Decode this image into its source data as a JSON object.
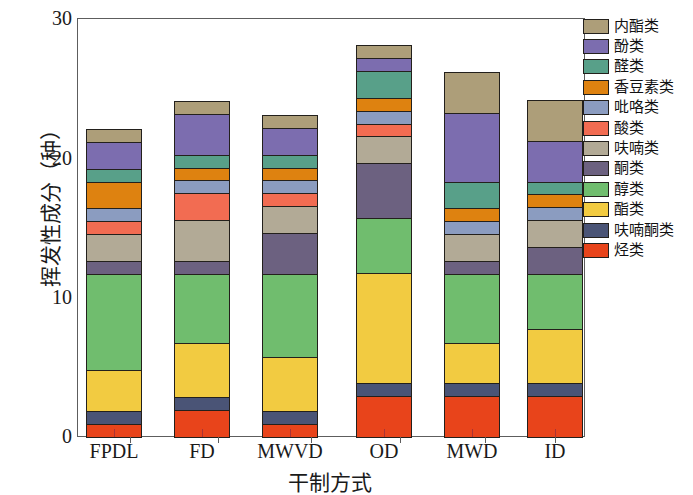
{
  "chart_data": {
    "type": "bar",
    "subtype": "stacked-bar",
    "title": "",
    "xlabel": "干制方式",
    "ylabel": "挥发性成分（种）",
    "categories": [
      "FPDL",
      "FD",
      "MWVD",
      "OD",
      "MWD",
      "ID"
    ],
    "ylim": [
      0,
      30
    ],
    "yticks": [
      0,
      10,
      20,
      30
    ],
    "yticks_minor": [
      5,
      15,
      25
    ],
    "grid": false,
    "legend_position": "right",
    "stack_order_bottom_to_top": [
      "烃类",
      "呋喃酮类",
      "酯类",
      "醇类",
      "酮类",
      "呋喃类",
      "酸类",
      "吡咯类",
      "香豆素类",
      "醛类",
      "酚类",
      "内酯类"
    ],
    "series": [
      {
        "name": "烃类",
        "color": "#e8441b",
        "values": [
          1,
          2,
          1,
          3,
          3,
          3
        ]
      },
      {
        "name": "呋喃酮类",
        "color": "#4a5476",
        "values": [
          1,
          1,
          1,
          1,
          1,
          1
        ]
      },
      {
        "name": "酯类",
        "color": "#f2cb41",
        "values": [
          3,
          4,
          4,
          8,
          3,
          4
        ]
      },
      {
        "name": "醇类",
        "color": "#70bd6e",
        "values": [
          7,
          5,
          6,
          4,
          5,
          4
        ]
      },
      {
        "name": "酮类",
        "color": "#6c6180",
        "values": [
          1,
          1,
          3,
          4,
          1,
          2
        ]
      },
      {
        "name": "呋喃类",
        "color": "#b2aa96",
        "values": [
          2,
          3,
          2,
          2,
          2,
          2
        ]
      },
      {
        "name": "酸类",
        "color": "#f26c52",
        "values": [
          1,
          2,
          1,
          1,
          0,
          0
        ]
      },
      {
        "name": "吡咯类",
        "color": "#8b9cc0",
        "values": [
          1,
          1,
          1,
          1,
          1,
          1
        ]
      },
      {
        "name": "香豆素类",
        "color": "#de8210",
        "values": [
          2,
          1,
          1,
          1,
          1,
          1
        ]
      },
      {
        "name": "醛类",
        "color": "#58a089",
        "values": [
          1,
          1,
          1,
          2,
          2,
          1
        ]
      },
      {
        "name": "酚类",
        "color": "#7c6daf",
        "values": [
          2,
          3,
          2,
          1,
          5,
          3
        ]
      },
      {
        "name": "内酯类",
        "color": "#ad9e79",
        "values": [
          1,
          1,
          1,
          1,
          3,
          3
        ]
      }
    ],
    "totals": [
      23,
      25,
      24,
      29,
      27.8,
      24.9
    ]
  },
  "legend": {
    "items": [
      {
        "label": "内酯类",
        "color": "#ad9e79"
      },
      {
        "label": "酚类",
        "color": "#7c6daf"
      },
      {
        "label": "醛类",
        "color": "#58a089"
      },
      {
        "label": "香豆素类",
        "color": "#de8210"
      },
      {
        "label": "吡咯类",
        "color": "#8b9cc0"
      },
      {
        "label": "酸类",
        "color": "#f26c52"
      },
      {
        "label": "呋喃类",
        "color": "#b2aa96"
      },
      {
        "label": "酮类",
        "color": "#6c6180"
      },
      {
        "label": "醇类",
        "color": "#70bd6e"
      },
      {
        "label": "酯类",
        "color": "#f2cb41"
      },
      {
        "label": "呋喃酮类",
        "color": "#4a5476"
      },
      {
        "label": "烃类",
        "color": "#e8441b"
      }
    ]
  },
  "axes": {
    "y_title": "挥发性成分（种）",
    "x_title": "干制方式",
    "y_tick_labels": [
      "30",
      "20",
      "10",
      "0"
    ],
    "x_tick_labels": [
      "FPDL",
      "FD",
      "MWVD",
      "OD",
      "MWD",
      "ID"
    ]
  }
}
